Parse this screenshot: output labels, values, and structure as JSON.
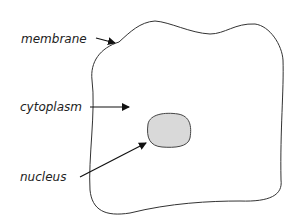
{
  "diagram": {
    "type": "cell",
    "labels": {
      "membrane": "membrane",
      "cytoplasm": "cytoplasm",
      "nucleus": "nucleus"
    },
    "colors": {
      "outline": "#333333",
      "nucleus_fill": "#d9d9d9",
      "background": "#ffffff"
    }
  }
}
